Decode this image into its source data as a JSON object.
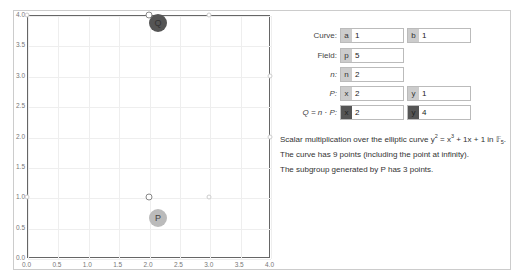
{
  "chart_data": {
    "type": "scatter",
    "title": "",
    "xlabel": "",
    "ylabel": "",
    "xlim": [
      0,
      4
    ],
    "ylim": [
      0,
      4
    ],
    "x_ticks": [
      "0.0",
      "0.5",
      "1.0",
      "1.5",
      "2.0",
      "2.5",
      "3.0",
      "3.5",
      "4.0"
    ],
    "y_ticks": [
      "0.0",
      "0.5",
      "1.0",
      "1.5",
      "2.0",
      "2.5",
      "3.0",
      "3.5",
      "4.0"
    ],
    "grid": true,
    "points": [
      {
        "x": 0,
        "y": 1
      },
      {
        "x": 0,
        "y": 4
      },
      {
        "x": 2,
        "y": 1
      },
      {
        "x": 2,
        "y": 4
      },
      {
        "x": 3,
        "y": 1
      },
      {
        "x": 3,
        "y": 4
      },
      {
        "x": 4,
        "y": 2
      },
      {
        "x": 4,
        "y": 3
      }
    ],
    "highlighted": [
      {
        "label": "P",
        "x": 2,
        "y": 1
      },
      {
        "label": "Q",
        "x": 2,
        "y": 4
      }
    ]
  },
  "markers": {
    "P": "P",
    "Q": "Q"
  },
  "controls": {
    "curve": {
      "label": "Curve:",
      "a_prefix": "a",
      "a_value": "1",
      "b_prefix": "b",
      "b_value": "1"
    },
    "field": {
      "label": "Field:",
      "p_prefix": "p",
      "p_value": "5"
    },
    "n": {
      "label": "n:",
      "n_prefix": "n",
      "n_value": "2"
    },
    "P": {
      "label": "P:",
      "x_prefix": "x",
      "x_value": "2",
      "y_prefix": "y",
      "y_value": "1"
    },
    "Q": {
      "label": "Q = n · P:",
      "x_prefix": "x",
      "x_value": "2",
      "y_prefix": "y",
      "y_value": "4"
    }
  },
  "description": {
    "line1_prefix": "Scalar multiplication over the elliptic curve y",
    "line1_exp1": "2",
    "line1_mid": " = x",
    "line1_exp2": "3",
    "line1_suffix": " + 1x + 1 in 𝔽",
    "line1_sub": "5",
    "line1_end": ".",
    "line2": "The curve has 9 points (including the point at infinity).",
    "line3": "The subgroup generated by P has 3 points."
  }
}
